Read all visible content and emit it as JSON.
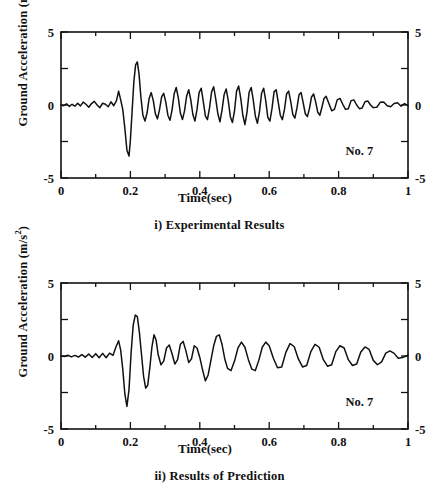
{
  "figure": {
    "panels": [
      {
        "id": "experimental",
        "caption": "i) Experimental Results",
        "annotation": "No. 7"
      },
      {
        "id": "prediction",
        "caption": "ii) Results of Prediction",
        "annotation": "No. 7"
      }
    ]
  },
  "axes": {
    "xlabel": "Time(sec)",
    "ylabel_text": "Ground Acceleration (m/s",
    "ylabel_exponent": "2",
    "ylabel_close": ")",
    "x_ticks": [
      "0",
      "0.2",
      "0.4",
      "0.6",
      "0.8",
      "1"
    ],
    "y_ticks": [
      "5",
      "0",
      "-5"
    ]
  },
  "style": {
    "line_color": "#111111",
    "background": "#ffffff"
  },
  "chart_data": [
    {
      "type": "line",
      "title": "i) Experimental Results",
      "xlabel": "Time(sec)",
      "ylabel": "Ground Acceleration (m/s^2)",
      "xlim": [
        0,
        1
      ],
      "ylim": [
        -5,
        5
      ],
      "xticks": [
        0,
        0.2,
        0.4,
        0.6,
        0.8,
        1
      ],
      "xminor_step": 0.1,
      "yticks": [
        -5,
        0,
        5
      ],
      "yminor": [
        -2.5,
        2.5
      ],
      "grid": false,
      "legend": null,
      "annotations": [
        {
          "text": "No. 7",
          "x": 0.86,
          "y": -3.4
        }
      ],
      "series": [
        {
          "name": "Ground acceleration (experimental)",
          "x": [
            0.0,
            0.008,
            0.016,
            0.024,
            0.032,
            0.04,
            0.048,
            0.056,
            0.064,
            0.072,
            0.08,
            0.088,
            0.096,
            0.104,
            0.112,
            0.12,
            0.128,
            0.136,
            0.144,
            0.152,
            0.16,
            0.166,
            0.172,
            0.178,
            0.184,
            0.19,
            0.196,
            0.2,
            0.205,
            0.21,
            0.215,
            0.22,
            0.225,
            0.23,
            0.236,
            0.242,
            0.248,
            0.254,
            0.26,
            0.266,
            0.272,
            0.278,
            0.284,
            0.29,
            0.296,
            0.302,
            0.308,
            0.314,
            0.32,
            0.326,
            0.332,
            0.338,
            0.344,
            0.35,
            0.356,
            0.362,
            0.368,
            0.374,
            0.38,
            0.386,
            0.392,
            0.398,
            0.404,
            0.41,
            0.416,
            0.422,
            0.428,
            0.434,
            0.44,
            0.446,
            0.452,
            0.458,
            0.464,
            0.47,
            0.476,
            0.482,
            0.488,
            0.494,
            0.5,
            0.506,
            0.512,
            0.518,
            0.524,
            0.53,
            0.536,
            0.542,
            0.548,
            0.554,
            0.56,
            0.566,
            0.572,
            0.578,
            0.584,
            0.59,
            0.596,
            0.602,
            0.608,
            0.614,
            0.62,
            0.626,
            0.632,
            0.638,
            0.644,
            0.65,
            0.656,
            0.662,
            0.668,
            0.674,
            0.68,
            0.686,
            0.692,
            0.698,
            0.704,
            0.71,
            0.716,
            0.722,
            0.728,
            0.734,
            0.74,
            0.746,
            0.752,
            0.758,
            0.764,
            0.772,
            0.78,
            0.788,
            0.796,
            0.804,
            0.812,
            0.82,
            0.828,
            0.836,
            0.844,
            0.852,
            0.86,
            0.868,
            0.876,
            0.884,
            0.892,
            0.9,
            0.91,
            0.92,
            0.93,
            0.94,
            0.95,
            0.96,
            0.97,
            0.98,
            0.99,
            1.0
          ],
          "y": [
            0.0,
            -0.05,
            0.08,
            -0.1,
            0.05,
            -0.08,
            0.12,
            -0.06,
            0.2,
            0.05,
            -0.15,
            0.1,
            0.25,
            0.0,
            -0.18,
            0.12,
            0.05,
            -0.12,
            0.22,
            -0.05,
            0.3,
            0.95,
            0.35,
            -0.3,
            -1.6,
            -3.1,
            -3.5,
            -2.4,
            -0.4,
            1.6,
            2.75,
            2.95,
            2.1,
            0.6,
            -0.7,
            -1.1,
            -0.55,
            0.45,
            0.85,
            0.3,
            -0.6,
            -0.95,
            -0.3,
            0.55,
            0.8,
            0.2,
            -0.7,
            -1.05,
            -0.35,
            0.75,
            1.2,
            0.5,
            -0.55,
            -1.0,
            -0.4,
            0.6,
            1.05,
            0.35,
            -0.65,
            -1.1,
            -0.3,
            0.85,
            1.15,
            0.25,
            -0.75,
            -1.0,
            -0.2,
            0.9,
            1.25,
            0.4,
            -0.6,
            -1.15,
            -0.35,
            0.7,
            1.1,
            0.3,
            -0.8,
            -1.2,
            -0.4,
            0.95,
            1.3,
            0.45,
            -0.7,
            -1.35,
            -0.5,
            0.85,
            1.2,
            0.35,
            -0.75,
            -1.25,
            -0.45,
            0.8,
            1.15,
            0.3,
            -0.85,
            -1.1,
            -0.25,
            0.9,
            1.05,
            0.2,
            -0.7,
            -1.0,
            -0.3,
            0.75,
            0.95,
            0.25,
            -0.65,
            -0.9,
            -0.2,
            0.7,
            0.85,
            0.15,
            -0.6,
            -0.8,
            -0.25,
            0.55,
            0.75,
            0.2,
            -0.5,
            -0.7,
            -0.15,
            0.45,
            0.6,
            0.1,
            -0.4,
            -0.3,
            0.35,
            0.45,
            0.05,
            -0.3,
            -0.25,
            0.3,
            0.35,
            0.0,
            -0.25,
            -0.2,
            0.22,
            0.28,
            0.0,
            -0.18,
            -0.15,
            0.18,
            0.2,
            -0.05,
            -0.12,
            0.1,
            0.15,
            -0.08,
            0.1,
            -0.05,
            0.08,
            -0.04,
            0.02
          ]
        }
      ]
    },
    {
      "type": "line",
      "title": "ii) Results of Prediction",
      "xlabel": "Time(sec)",
      "ylabel": "Ground Acceleration (m/s^2)",
      "xlim": [
        0,
        1
      ],
      "ylim": [
        -5,
        5
      ],
      "xticks": [
        0,
        0.2,
        0.4,
        0.6,
        0.8,
        1
      ],
      "xminor_step": 0.1,
      "yticks": [
        -5,
        0,
        5
      ],
      "yminor": [
        -2.5,
        2.5
      ],
      "grid": false,
      "legend": null,
      "annotations": [
        {
          "text": "No. 7",
          "x": 0.86,
          "y": -3.4
        }
      ],
      "series": [
        {
          "name": "Ground acceleration (prediction)",
          "x": [
            0.0,
            0.01,
            0.02,
            0.03,
            0.04,
            0.05,
            0.06,
            0.07,
            0.08,
            0.09,
            0.1,
            0.11,
            0.12,
            0.13,
            0.14,
            0.15,
            0.158,
            0.166,
            0.172,
            0.178,
            0.184,
            0.19,
            0.196,
            0.202,
            0.208,
            0.214,
            0.22,
            0.226,
            0.232,
            0.238,
            0.244,
            0.25,
            0.256,
            0.262,
            0.268,
            0.274,
            0.28,
            0.288,
            0.296,
            0.304,
            0.312,
            0.32,
            0.328,
            0.336,
            0.344,
            0.352,
            0.36,
            0.368,
            0.376,
            0.384,
            0.392,
            0.4,
            0.408,
            0.416,
            0.424,
            0.432,
            0.44,
            0.448,
            0.456,
            0.464,
            0.472,
            0.48,
            0.49,
            0.5,
            0.51,
            0.52,
            0.53,
            0.54,
            0.55,
            0.56,
            0.57,
            0.58,
            0.59,
            0.6,
            0.612,
            0.624,
            0.636,
            0.648,
            0.66,
            0.672,
            0.684,
            0.696,
            0.708,
            0.72,
            0.732,
            0.744,
            0.756,
            0.768,
            0.78,
            0.792,
            0.804,
            0.816,
            0.828,
            0.84,
            0.852,
            0.864,
            0.876,
            0.888,
            0.9,
            0.912,
            0.924,
            0.936,
            0.948,
            0.96,
            0.972,
            0.984,
            1.0
          ],
          "y": [
            0.0,
            -0.03,
            0.05,
            -0.06,
            0.04,
            -0.07,
            0.1,
            -0.08,
            0.14,
            -0.1,
            0.16,
            -0.12,
            0.18,
            -0.12,
            0.2,
            0.05,
            0.6,
            1.05,
            0.4,
            -0.9,
            -2.6,
            -3.45,
            -2.3,
            0.2,
            2.1,
            2.8,
            2.7,
            1.6,
            0.1,
            -1.4,
            -2.2,
            -2.0,
            -0.8,
            0.6,
            1.45,
            1.1,
            0.1,
            -0.6,
            -0.35,
            0.55,
            0.75,
            0.15,
            -0.55,
            -0.25,
            0.8,
            1.0,
            0.35,
            -0.45,
            -0.2,
            0.7,
            0.55,
            -0.1,
            -0.95,
            -1.7,
            -1.3,
            -0.3,
            0.7,
            1.35,
            1.45,
            0.8,
            -0.2,
            -0.85,
            -1.0,
            -0.35,
            0.55,
            0.95,
            0.6,
            -0.25,
            -0.9,
            -1.0,
            -0.3,
            0.6,
            0.95,
            0.7,
            -0.15,
            -0.8,
            -0.75,
            0.25,
            0.85,
            0.65,
            -0.2,
            -0.75,
            -0.65,
            0.3,
            0.8,
            0.6,
            -0.25,
            -0.7,
            -0.6,
            0.3,
            0.7,
            0.55,
            -0.25,
            -0.65,
            -0.55,
            0.28,
            0.62,
            0.45,
            -0.3,
            -0.6,
            -0.4,
            0.2,
            0.35,
            0.18,
            -0.15,
            -0.1,
            0.05,
            0.0
          ]
        }
      ]
    }
  ]
}
